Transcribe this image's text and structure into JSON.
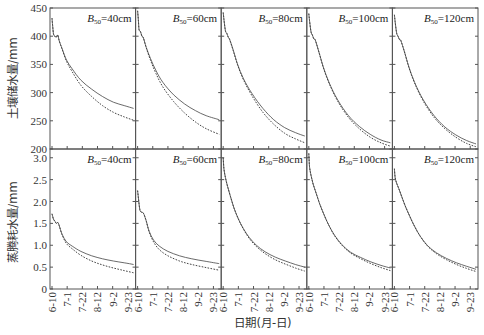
{
  "chart_data": {
    "type": "line",
    "title": "",
    "xlabel": "日期(月-日)",
    "x_ticks": [
      "6-10",
      "7-1",
      "7-22",
      "8-12",
      "9-2",
      "9-23"
    ],
    "x_tick_positions": [
      0,
      21,
      42,
      63,
      84,
      105
    ],
    "x_range": [
      0,
      113
    ],
    "grid": false,
    "legend": "none (solid vs dashed line per panel)",
    "panel_labels": [
      "B50=40cm",
      "B50=60cm",
      "B50=80cm",
      "B50=100cm",
      "B50=120cm"
    ],
    "rows": [
      {
        "ylabel": "土壤储水量/mm",
        "ylim": [
          200,
          450
        ],
        "y_ticks": [
          200,
          250,
          300,
          350,
          400,
          450
        ],
        "panels": [
          {
            "label": "B50=40cm",
            "series": [
              {
                "name": "solid",
                "style": "solid",
                "x": [
                  0,
                  2,
                  4,
                  6,
                  8,
                  10,
                  14,
                  20,
                  28,
                  40,
                  55,
                  70,
                  85,
                  100,
                  113
                ],
                "y": [
                  432,
                  405,
                  400,
                  398,
                  402,
                  392,
                  378,
                  358,
                  342,
                  322,
                  306,
                  293,
                  283,
                  277,
                  272
                ]
              },
              {
                "name": "dashed",
                "style": "dashed",
                "x": [
                  0,
                  2,
                  4,
                  6,
                  8,
                  10,
                  14,
                  20,
                  28,
                  40,
                  55,
                  70,
                  85,
                  100,
                  113
                ],
                "y": [
                  432,
                  405,
                  400,
                  398,
                  402,
                  392,
                  377,
                  356,
                  337,
                  313,
                  293,
                  277,
                  265,
                  257,
                  251
                ]
              }
            ]
          },
          {
            "label": "B50=60cm",
            "series": [
              {
                "name": "solid",
                "style": "solid",
                "x": [
                  0,
                  1,
                  2,
                  4,
                  6,
                  8,
                  12,
                  18,
                  25,
                  35,
                  50,
                  65,
                  80,
                  95,
                  113
                ],
                "y": [
                  445,
                  430,
                  412,
                  408,
                  400,
                  397,
                  380,
                  360,
                  340,
                  318,
                  296,
                  280,
                  268,
                  259,
                  252
                ]
              },
              {
                "name": "dashed",
                "style": "dashed",
                "x": [
                  0,
                  1,
                  2,
                  4,
                  6,
                  8,
                  12,
                  18,
                  25,
                  35,
                  50,
                  65,
                  80,
                  95,
                  113
                ],
                "y": [
                  445,
                  430,
                  412,
                  408,
                  400,
                  397,
                  379,
                  357,
                  335,
                  310,
                  284,
                  264,
                  248,
                  236,
                  226
                ]
              }
            ]
          },
          {
            "label": "B50=80cm",
            "series": [
              {
                "name": "solid",
                "style": "solid",
                "x": [
                  0,
                  1,
                  3,
                  5,
                  7,
                  9,
                  14,
                  20,
                  28,
                  40,
                  55,
                  70,
                  85,
                  100,
                  113
                ],
                "y": [
                  442,
                  430,
                  410,
                  405,
                  398,
                  394,
                  375,
                  350,
                  325,
                  298,
                  272,
                  252,
                  238,
                  229,
                  223
                ]
              },
              {
                "name": "dashed",
                "style": "dashed",
                "x": [
                  0,
                  1,
                  3,
                  5,
                  7,
                  9,
                  14,
                  20,
                  28,
                  40,
                  55,
                  70,
                  85,
                  100,
                  113
                ],
                "y": [
                  442,
                  430,
                  410,
                  405,
                  398,
                  394,
                  374,
                  349,
                  323,
                  294,
                  265,
                  244,
                  228,
                  218,
                  211
                ]
              }
            ]
          },
          {
            "label": "B50=100cm",
            "series": [
              {
                "name": "solid",
                "style": "solid",
                "x": [
                  0,
                  1,
                  3,
                  5,
                  7,
                  9,
                  14,
                  20,
                  28,
                  40,
                  55,
                  70,
                  85,
                  100,
                  113
                ],
                "y": [
                  440,
                  428,
                  408,
                  402,
                  395,
                  393,
                  372,
                  346,
                  318,
                  287,
                  259,
                  240,
                  226,
                  216,
                  211
                ]
              },
              {
                "name": "dashed",
                "style": "dashed",
                "x": [
                  0,
                  1,
                  3,
                  5,
                  7,
                  9,
                  14,
                  20,
                  28,
                  40,
                  55,
                  70,
                  85,
                  100,
                  113
                ],
                "y": [
                  440,
                  428,
                  408,
                  402,
                  395,
                  393,
                  372,
                  345,
                  317,
                  285,
                  256,
                  236,
                  221,
                  211,
                  205
                ]
              }
            ]
          },
          {
            "label": "B50=120cm",
            "series": [
              {
                "name": "solid",
                "style": "solid",
                "x": [
                  0,
                  1,
                  3,
                  5,
                  7,
                  9,
                  14,
                  20,
                  28,
                  40,
                  55,
                  70,
                  85,
                  100,
                  113
                ],
                "y": [
                  438,
                  426,
                  406,
                  400,
                  394,
                  392,
                  372,
                  346,
                  318,
                  287,
                  259,
                  239,
                  225,
                  215,
                  209
                ]
              },
              {
                "name": "dashed",
                "style": "dashed",
                "x": [
                  0,
                  1,
                  3,
                  5,
                  7,
                  9,
                  14,
                  20,
                  28,
                  40,
                  55,
                  70,
                  85,
                  100,
                  113
                ],
                "y": [
                  438,
                  426,
                  406,
                  400,
                  394,
                  392,
                  372,
                  345,
                  317,
                  285,
                  256,
                  236,
                  221,
                  210,
                  204
                ]
              }
            ]
          }
        ]
      },
      {
        "ylabel": "蒸腾耗水量/mm",
        "ylim": [
          0,
          3.2
        ],
        "y_ticks": [
          0,
          0.5,
          1.0,
          1.5,
          2.0,
          2.5,
          3.0
        ],
        "y_tick_labels": [
          "0",
          "0.5",
          "1.0",
          "1.5",
          "2.0",
          "2.5",
          "3.0"
        ],
        "panels": [
          {
            "label": "B50=40cm",
            "series": [
              {
                "name": "solid",
                "style": "solid",
                "x": [
                  0,
                  2,
                  4,
                  6,
                  8,
                  10,
                  14,
                  20,
                  28,
                  40,
                  55,
                  70,
                  85,
                  100,
                  113
                ],
                "y": [
                  1.72,
                  1.6,
                  1.55,
                  1.5,
                  1.52,
                  1.45,
                  1.25,
                  1.08,
                  0.98,
                  0.86,
                  0.76,
                  0.69,
                  0.64,
                  0.6,
                  0.56
                ]
              },
              {
                "name": "dashed",
                "style": "dashed",
                "x": [
                  0,
                  2,
                  4,
                  6,
                  8,
                  10,
                  14,
                  20,
                  28,
                  40,
                  55,
                  70,
                  85,
                  100,
                  113
                ],
                "y": [
                  1.72,
                  1.6,
                  1.55,
                  1.5,
                  1.52,
                  1.45,
                  1.24,
                  1.04,
                  0.92,
                  0.77,
                  0.64,
                  0.55,
                  0.48,
                  0.42,
                  0.37
                ]
              }
            ]
          },
          {
            "label": "B50=60cm",
            "series": [
              {
                "name": "solid",
                "style": "solid",
                "x": [
                  0,
                  1,
                  3,
                  5,
                  7,
                  9,
                  12,
                  16,
                  22,
                  30,
                  42,
                  58,
                  75,
                  95,
                  113
                ],
                "y": [
                  2.25,
                  2.1,
                  1.82,
                  1.76,
                  1.75,
                  1.7,
                  1.55,
                  1.32,
                  1.12,
                  0.98,
                  0.86,
                  0.76,
                  0.69,
                  0.63,
                  0.58
                ]
              },
              {
                "name": "dashed",
                "style": "dashed",
                "x": [
                  0,
                  1,
                  3,
                  5,
                  7,
                  9,
                  12,
                  16,
                  22,
                  30,
                  42,
                  58,
                  75,
                  95,
                  113
                ],
                "y": [
                  2.25,
                  2.1,
                  1.82,
                  1.76,
                  1.75,
                  1.7,
                  1.55,
                  1.3,
                  1.08,
                  0.9,
                  0.76,
                  0.64,
                  0.56,
                  0.49,
                  0.43
                ]
              }
            ]
          },
          {
            "label": "B50=80cm",
            "series": [
              {
                "name": "solid",
                "style": "solid",
                "x": [
                  0,
                  1,
                  3,
                  6,
                  10,
                  15,
                  21,
                  28,
                  36,
                  46,
                  58,
                  72,
                  86,
                  100,
                  113
                ],
                "y": [
                  3.0,
                  2.75,
                  2.55,
                  2.35,
                  2.12,
                  1.85,
                  1.6,
                  1.38,
                  1.18,
                  1.0,
                  0.85,
                  0.73,
                  0.64,
                  0.56,
                  0.5
                ]
              },
              {
                "name": "dashed",
                "style": "dashed",
                "x": [
                  0,
                  1,
                  3,
                  6,
                  10,
                  15,
                  21,
                  28,
                  36,
                  46,
                  58,
                  72,
                  86,
                  100,
                  113
                ],
                "y": [
                  3.0,
                  2.75,
                  2.55,
                  2.35,
                  2.12,
                  1.85,
                  1.6,
                  1.37,
                  1.16,
                  0.97,
                  0.81,
                  0.67,
                  0.57,
                  0.48,
                  0.41
                ]
              }
            ]
          },
          {
            "label": "B50=100cm",
            "series": [
              {
                "name": "solid",
                "style": "solid",
                "x": [
                  0,
                  1,
                  3,
                  6,
                  10,
                  15,
                  21,
                  28,
                  36,
                  46,
                  58,
                  72,
                  86,
                  100,
                  113
                ],
                "y": [
                  3.1,
                  2.8,
                  2.6,
                  2.4,
                  2.2,
                  1.95,
                  1.7,
                  1.45,
                  1.22,
                  1.01,
                  0.84,
                  0.72,
                  0.62,
                  0.54,
                  0.48
                ]
              },
              {
                "name": "dashed",
                "style": "dashed",
                "x": [
                  0,
                  1,
                  3,
                  6,
                  10,
                  15,
                  21,
                  28,
                  36,
                  46,
                  58,
                  72,
                  86,
                  100,
                  113
                ],
                "y": [
                  3.1,
                  2.8,
                  2.6,
                  2.4,
                  2.2,
                  1.95,
                  1.7,
                  1.45,
                  1.21,
                  1.0,
                  0.82,
                  0.69,
                  0.58,
                  0.49,
                  0.42
                ]
              }
            ]
          },
          {
            "label": "B50=120cm",
            "series": [
              {
                "name": "solid",
                "style": "solid",
                "x": [
                  0,
                  1,
                  3,
                  6,
                  10,
                  15,
                  21,
                  28,
                  36,
                  46,
                  58,
                  72,
                  86,
                  100,
                  113
                ],
                "y": [
                  2.75,
                  2.55,
                  2.42,
                  2.3,
                  2.12,
                  1.9,
                  1.67,
                  1.43,
                  1.2,
                  0.99,
                  0.83,
                  0.7,
                  0.6,
                  0.52,
                  0.45
                ]
              },
              {
                "name": "dashed",
                "style": "dashed",
                "x": [
                  0,
                  1,
                  3,
                  6,
                  10,
                  15,
                  21,
                  28,
                  36,
                  46,
                  58,
                  72,
                  86,
                  100,
                  113
                ],
                "y": [
                  2.75,
                  2.55,
                  2.42,
                  2.3,
                  2.12,
                  1.9,
                  1.67,
                  1.43,
                  1.2,
                  0.98,
                  0.81,
                  0.67,
                  0.56,
                  0.47,
                  0.4
                ]
              }
            ]
          }
        ]
      }
    ]
  },
  "layout_labels": {
    "row_titles": [
      "土壤储水量/mm",
      "蒸腾耗水量/mm"
    ],
    "x_title": "日期(月-日)",
    "panel_labels": [
      {
        "main": "B",
        "sub": "50",
        "rest": "=40cm"
      },
      {
        "main": "B",
        "sub": "50",
        "rest": "=60cm"
      },
      {
        "main": "B",
        "sub": "50",
        "rest": "=80cm"
      },
      {
        "main": "B",
        "sub": "50",
        "rest": "=100cm"
      },
      {
        "main": "B",
        "sub": "50",
        "rest": "=120cm"
      }
    ]
  }
}
